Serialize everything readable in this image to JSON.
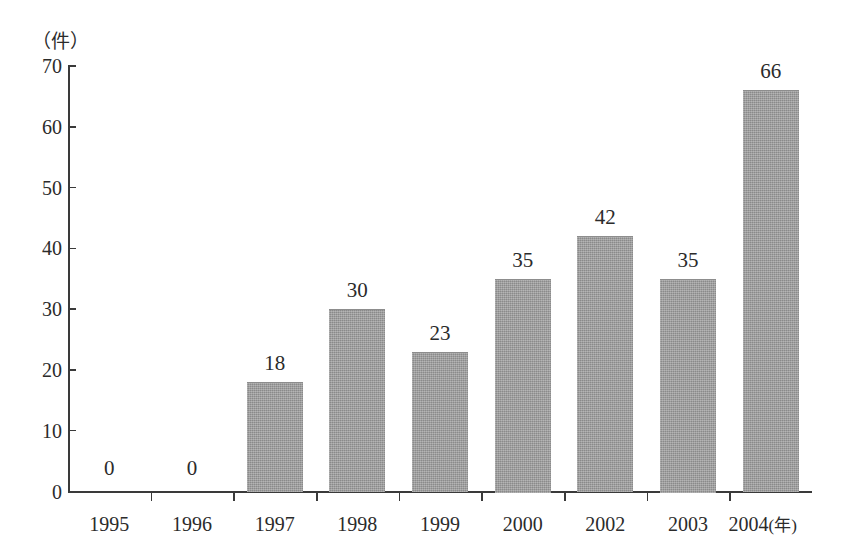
{
  "chart_data": {
    "type": "bar",
    "title": "",
    "subtitle": "",
    "xlabel": "年",
    "ylabel": "件",
    "categories": [
      "1995",
      "1996",
      "1997",
      "1998",
      "1999",
      "2000",
      "2002",
      "2003",
      "2004"
    ],
    "values": [
      0,
      0,
      18,
      30,
      23,
      35,
      42,
      35,
      66
    ],
    "data_labels": [
      "0",
      "0",
      "18",
      "30",
      "23",
      "35",
      "42",
      "35",
      "66"
    ],
    "ylim": [
      0,
      70
    ],
    "ytick_labels": [
      "0",
      "10",
      "20",
      "30",
      "40",
      "50",
      "60",
      "70"
    ],
    "ytick_values": [
      0,
      10,
      20,
      30,
      40,
      50,
      60,
      70
    ],
    "grid": false,
    "legend": null,
    "legend_position": "none",
    "bar_color": "#989898",
    "axis_color": "#3a3a3a",
    "text_color": "#2b2b2b",
    "background_color": "#ffffff"
  },
  "axes": {
    "y_unit_label": "（件）",
    "x_unit_label": "(年)"
  }
}
